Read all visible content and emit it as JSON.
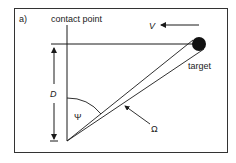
{
  "diagram": {
    "panel_label": "a)",
    "labels": {
      "contact_point": "contact point",
      "velocity": "V",
      "target": "target",
      "distance": "D",
      "angle_psi": "Ψ",
      "angle_omega": "Ω"
    },
    "colors": {
      "stroke": "#1a1a1a",
      "target_fill": "#111111",
      "frame": "#333333"
    }
  }
}
